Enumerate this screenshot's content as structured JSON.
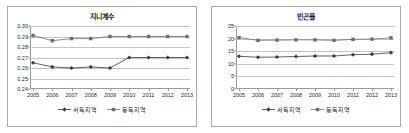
{
  "charts": [
    {
      "panel_name": "gini-panel",
      "title": "지니계수",
      "legend": [
        {
          "label": "서독지역",
          "marker": "diamond",
          "color": "#3a3a3a"
        },
        {
          "label": "동독지역",
          "marker": "square",
          "color": "#6e6e6e"
        }
      ],
      "chart_data": {
        "type": "line",
        "title": "지니계수",
        "xlabel": "",
        "ylabel": "",
        "categories": [
          "2005",
          "2006",
          "2007",
          "2008",
          "2009",
          "2010",
          "2011",
          "2012",
          "2013"
        ],
        "ylim": [
          0.24,
          0.3
        ],
        "ytick_labels": [
          "0.30",
          "0.29",
          "0.28",
          "0.27",
          "0.26",
          "0.25",
          "0.24"
        ],
        "ytick_values": [
          0.3,
          0.29,
          0.28,
          0.27,
          0.26,
          0.25,
          0.24
        ],
        "grid": true,
        "legend_position": "bottom",
        "series": [
          {
            "name": "동독지역",
            "values": [
              0.291,
              0.286,
              0.288,
              0.288,
              0.29,
              0.29,
              0.29,
              0.29,
              0.29
            ]
          },
          {
            "name": "서독지역",
            "values": [
              0.265,
              0.261,
              0.26,
              0.261,
              0.26,
              0.27,
              0.27,
              0.27,
              0.27
            ]
          }
        ]
      }
    },
    {
      "panel_name": "poverty-panel",
      "title": "빈곤율",
      "legend": [
        {
          "label": "서독지역",
          "marker": "diamond",
          "color": "#3a3a3a"
        },
        {
          "label": "동독지역",
          "marker": "square",
          "color": "#6e6e6e"
        }
      ],
      "chart_data": {
        "type": "line",
        "title": "빈곤율",
        "xlabel": "",
        "ylabel": "",
        "categories": [
          "2005",
          "2006",
          "2007",
          "2008",
          "2009",
          "2010",
          "2011",
          "2012",
          "2013"
        ],
        "ylim": [
          0,
          25
        ],
        "ytick_labels": [
          "25",
          "20",
          "15",
          "10",
          "5",
          "0"
        ],
        "ytick_values": [
          25,
          20,
          15,
          10,
          5,
          0
        ],
        "grid": true,
        "legend_position": "bottom",
        "series": [
          {
            "name": "동독지역",
            "values": [
              20.4,
              19.3,
              19.4,
              19.5,
              19.5,
              19.3,
              19.7,
              19.8,
              20.3
            ]
          },
          {
            "name": "서독지역",
            "values": [
              13.0,
              12.6,
              12.7,
              12.9,
              13.1,
              13.1,
              13.6,
              13.8,
              14.4
            ]
          }
        ]
      }
    }
  ]
}
